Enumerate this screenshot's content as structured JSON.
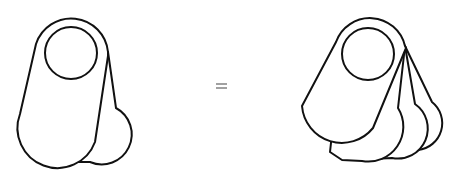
{
  "diagram": {
    "left_figure": {
      "label": "two stacked tags",
      "tag_count": 2
    },
    "operator": {
      "symbol": "=",
      "color": "#8a8a8a"
    },
    "right_figure": {
      "label": "four fanned tags",
      "tag_count": 4
    },
    "colors": {
      "stroke": "#111111",
      "fill": "#ffffff",
      "background": "#ffffff"
    }
  }
}
